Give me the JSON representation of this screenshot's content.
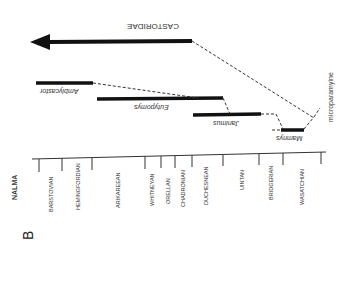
{
  "figure": {
    "panel_label": "B",
    "axis_title": "NALMA",
    "clade_label": "CASTORIDAE",
    "node_label": "microparamyine",
    "ages": [
      {
        "name": "BARSTOVIAN",
        "x": 48
      },
      {
        "name": "HEMINGFORDIAN",
        "x": 78
      },
      {
        "name": "ARIKAREEAN",
        "x": 118
      },
      {
        "name": "WHITNEYAN",
        "x": 153
      },
      {
        "name": "ORELLAN",
        "x": 168
      },
      {
        "name": "CHADRONIAN",
        "x": 184
      },
      {
        "name": "DUCHESNEAN",
        "x": 207
      },
      {
        "name": "UINTAN",
        "x": 241
      },
      {
        "name": "BRIDGERIAN",
        "x": 271
      },
      {
        "name": "WASATCHIAN",
        "x": 302
      }
    ],
    "tick_x": [
      39,
      62,
      92,
      145,
      161,
      175,
      192,
      223,
      259,
      283,
      321
    ],
    "taxa": [
      {
        "name": "Amblycastor",
        "x1": 36,
        "x2": 93,
        "y": 83
      },
      {
        "name": "Eutypomys",
        "x1": 97,
        "x2": 223,
        "y": 99
      },
      {
        "name": "Janimus",
        "x1": 193,
        "x2": 261,
        "y": 114
      },
      {
        "name": "Mamnys",
        "x1": 281,
        "x2": 304,
        "y": 130
      }
    ]
  }
}
